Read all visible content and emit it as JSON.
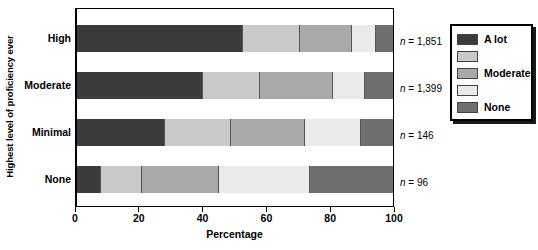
{
  "chart_data": {
    "type": "bar",
    "orientation": "horizontal",
    "stacked": true,
    "stack_mode": "percent",
    "title": "",
    "xlabel": "Percentage",
    "ylabel": "Highest level of proficiency ever",
    "xlim": [
      0,
      100
    ],
    "xticks": [
      0,
      20,
      40,
      60,
      80,
      100
    ],
    "xticklabels": [
      "0",
      "20",
      "40",
      "60",
      "80",
      "100"
    ],
    "grid": false,
    "legend_position": "right-outside",
    "categories": [
      "High",
      "Moderate",
      "Minimal",
      "None"
    ],
    "annotations": [
      "n = 1,851",
      "n = 1,399",
      "n = 146",
      "n = 96"
    ],
    "group_sizes": [
      1851,
      1399,
      146,
      96
    ],
    "series": [
      {
        "name": "A lot",
        "color": "#3b3b3b",
        "values": [
          52.4,
          40.0,
          28.0,
          7.5
        ]
      },
      {
        "name": "",
        "color": "#c9c9c9",
        "values": [
          18.2,
          18.0,
          20.6,
          13.2
        ]
      },
      {
        "name": "Moderate",
        "color": "#a9a9a9",
        "values": [
          16.4,
          23.0,
          23.4,
          24.3
        ]
      },
      {
        "name": "",
        "color": "#eaeaea",
        "values": [
          7.7,
          10.0,
          18.0,
          28.7
        ]
      },
      {
        "name": "None",
        "color": "#6f6f6f",
        "values": [
          5.3,
          9.0,
          10.0,
          26.3
        ]
      }
    ],
    "legend_entries": [
      {
        "label": "A lot",
        "color": "#3b3b3b"
      },
      {
        "label": "",
        "color": "#c9c9c9"
      },
      {
        "label": "Moderate",
        "color": "#a9a9a9"
      },
      {
        "label": "",
        "color": "#eaeaea"
      },
      {
        "label": "None",
        "color": "#6f6f6f"
      }
    ]
  }
}
